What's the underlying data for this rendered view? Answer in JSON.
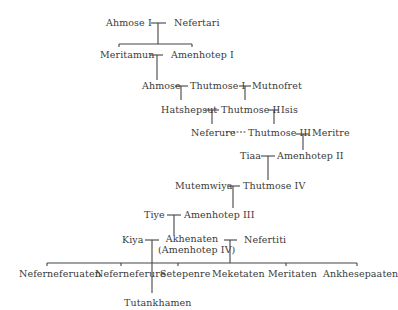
{
  "diagram": {
    "type": "family-tree",
    "generations": [
      {
        "couple": [
          "Ahmose I",
          "Nefertari"
        ]
      },
      {
        "couple": [
          "Meritamun",
          "Amenhotep I"
        ]
      },
      {
        "couple": [
          "Ahmose",
          "Thutmose I",
          "Mutnofret"
        ]
      },
      {
        "couple": [
          "Hatshepsut",
          "Thutmose II",
          "Isis"
        ]
      },
      {
        "couple": [
          "Neferure",
          "Thutmose III",
          "Meritre"
        ]
      },
      {
        "couple": [
          "Tiaa",
          "Amenhotep II"
        ]
      },
      {
        "couple": [
          "Mutemwiya",
          "Thutmose IV"
        ]
      },
      {
        "couple": [
          "Tiye",
          "Amenhotep III"
        ]
      },
      {
        "couple": [
          "Kiya",
          "Akhenaten (Amenhotep IV)",
          "Nefertiti"
        ]
      }
    ],
    "people": {
      "ahmose_i": "Ahmose I",
      "nefertari": "Nefertari",
      "meritamun": "Meritamun",
      "amenhotep_i": "Amenhotep I",
      "ahmose": "Ahmose",
      "thutmose_i": "Thutmose I",
      "mutnofret": "Mutnofret",
      "hatshepsut": "Hatshepsut",
      "thutmose_ii": "Thutmose II",
      "isis": "Isis",
      "neferure": "Neferure",
      "thutmose_iii": "Thutmose III",
      "meritre": "Meritre",
      "tiaa": "Tiaa",
      "amenhotep_ii": "Amenhotep II",
      "mutemwiya": "Mutemwiya",
      "thutmose_iv": "Thutmose IV",
      "tiye": "Tiye",
      "amenhotep_iii": "Amenhotep III",
      "kiya": "Kiya",
      "akhenaten": "Akhenaten",
      "akhenaten_alt": "(Amenhotep IV)",
      "nefertiti": "Nefertiti",
      "tutankhamen": "Tutankhamen"
    },
    "children_of_akhenaten_nefertiti": [
      "Neferneferuaten",
      "Neferneferure",
      "Setepenre",
      "Meketaten",
      "Meritaten",
      "Ankhesepaaten"
    ]
  }
}
